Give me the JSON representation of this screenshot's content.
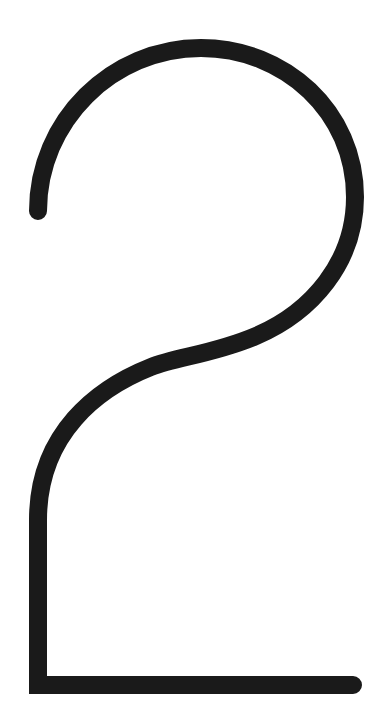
{
  "canvas": {
    "width": 380,
    "height": 725,
    "background_color": "#ffffff",
    "title": "Numeral Two Glyph"
  },
  "glyph": {
    "name": "digit-two",
    "character": "2",
    "description": "Large thin-stroke stylized numeral two drawn as a single open monoline path",
    "stroke_color": "#1a1a1a",
    "stroke_width": 18,
    "stroke_linecap": "round",
    "stroke_linejoin": "miter",
    "fill": "none",
    "path": "M 38 211 C 38 121 112 48 201 48 C 285 48 355 112 355 197 C 355 262 312 312 256 336 C 214 354 176 357 151 367 C 98 388 38 433 38 520 L 38 685 L 353 685",
    "bounding_box": {
      "x": 29,
      "y": 39,
      "width": 333,
      "height": 656
    },
    "anchor_points": {
      "top_terminal": {
        "x": 38,
        "y": 211
      },
      "arc_apex": {
        "x": 201,
        "y": 48
      },
      "right_extreme": {
        "x": 355,
        "y": 197
      },
      "inflection": {
        "x": 178,
        "y": 366
      },
      "stem_top": {
        "x": 38,
        "y": 520
      },
      "corner": {
        "x": 38,
        "y": 685
      },
      "baseline_terminal": {
        "x": 353,
        "y": 685
      }
    }
  }
}
